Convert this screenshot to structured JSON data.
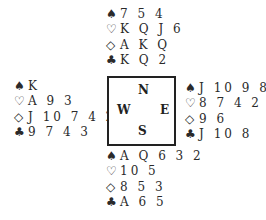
{
  "diagram": {
    "type": "bridge-deal",
    "hands": {
      "north": {
        "spades": "7 5 4",
        "hearts": "K Q J 6",
        "diamonds": "A K Q",
        "clubs": "K Q 2"
      },
      "west": {
        "spades": "K",
        "hearts": "A 9 3",
        "diamonds": "J 10 7 4 2",
        "clubs": "9 7 4 3"
      },
      "east": {
        "spades": "J 10 9 8",
        "hearts": "8 7 4 2",
        "diamonds": "9 6",
        "clubs": "J 10 8"
      },
      "south": {
        "spades": "A Q 6 3 2",
        "hearts": "10 5",
        "diamonds": "8 5 3",
        "clubs": "A 6 5"
      }
    },
    "compass": {
      "n": "N",
      "w": "W",
      "e": "E",
      "s": "S"
    },
    "suit_symbols": {
      "spades": "♠",
      "hearts": "♡",
      "diamonds": "◇",
      "clubs": "♣"
    }
  }
}
